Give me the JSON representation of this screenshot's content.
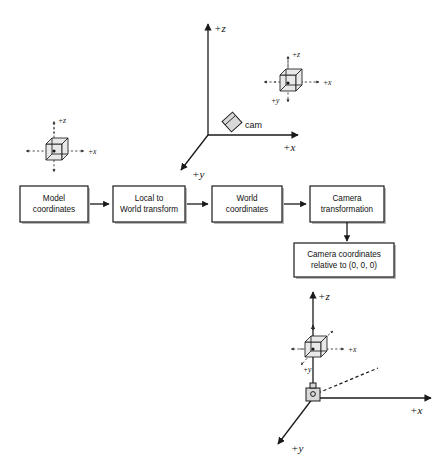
{
  "diagram": {
    "background_color": "#ffffff",
    "ink_color": "#1a1a1a"
  },
  "pipeline": {
    "boxes": [
      {
        "id": "model-coordinates",
        "line1": "Model",
        "line2": "coordinates"
      },
      {
        "id": "local-to-world",
        "line1": "Local to",
        "line2": "World transform"
      },
      {
        "id": "world-coordinates",
        "line1": "World",
        "line2": "coordinates"
      },
      {
        "id": "camera-transformation",
        "line1": "Camera",
        "line2": "transformation"
      },
      {
        "id": "camera-coordinates",
        "line1": "Camera coordinates",
        "line2": "relative to (0, 0, 0)"
      }
    ]
  },
  "model_axes": {
    "name": "model-coordinate-system",
    "z_label": "+z",
    "x_label": "+x",
    "object": "cube"
  },
  "world_axes": {
    "name": "world-coordinate-system",
    "z_label": "+z",
    "x_label": "+x",
    "y_label": "+y",
    "camera_label": "cam",
    "cube_axes": {
      "z_label": "+z",
      "x_label": "+x",
      "y_label": "+y"
    }
  },
  "camera_axes": {
    "name": "camera-coordinate-system",
    "z_label": "+z",
    "x_label": "+x",
    "y_label": "+y",
    "cube_axes": {
      "x_label": "+x",
      "y_label": "+y"
    }
  }
}
